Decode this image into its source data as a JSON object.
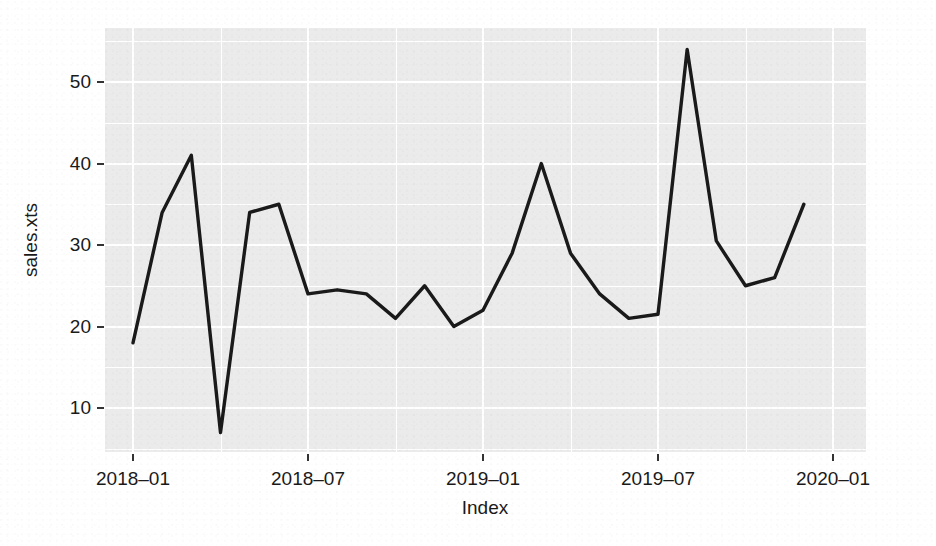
{
  "chart_data": {
    "type": "line",
    "title": "",
    "subtitle": "",
    "xlabel": "Index",
    "ylabel": "sales.xts",
    "x": [
      "2018-01",
      "2018-02",
      "2018-03",
      "2018-04",
      "2018-05",
      "2018-06",
      "2018-07",
      "2018-08",
      "2018-09",
      "2018-10",
      "2018-11",
      "2018-12",
      "2019-01",
      "2019-02",
      "2019-03",
      "2019-04",
      "2019-05",
      "2019-06",
      "2019-07",
      "2019-08",
      "2019-09",
      "2019-10",
      "2019-11",
      "2019-12"
    ],
    "values": [
      18,
      34,
      41,
      7,
      34,
      35,
      24,
      24.5,
      24,
      21,
      25,
      20,
      22,
      29,
      40,
      29,
      24,
      21,
      21.5,
      54,
      30.5,
      25,
      26,
      35
    ],
    "series": [
      {
        "name": "sales.xts",
        "values": [
          18,
          34,
          41,
          7,
          34,
          35,
          24,
          24.5,
          24,
          21,
          25,
          20,
          22,
          29,
          40,
          29,
          24,
          21,
          21.5,
          54,
          30.5,
          25,
          26,
          35
        ]
      }
    ],
    "x_tick_labels": [
      "2018–01",
      "2018–07",
      "2019–01",
      "2019–07",
      "2020–01"
    ],
    "x_tick_values": [
      "2018-01",
      "2018-07",
      "2019-01",
      "2019-07",
      "2020-01"
    ],
    "y_tick_labels": [
      "10",
      "20",
      "30",
      "40",
      "50"
    ],
    "y_tick_values": [
      10,
      20,
      30,
      40,
      50
    ],
    "xlim": [
      "2017-12-10",
      "2020-01-14"
    ],
    "ylim": [
      5.6,
      56.0
    ],
    "grid": true,
    "legend": "none",
    "line_color": "#1a1a1a",
    "panel_background": "#ebebeb",
    "grid_color": "#ffffff",
    "page_background": "#ffffff"
  },
  "axes": {
    "y_title": "sales.xts",
    "x_title": "Index"
  }
}
